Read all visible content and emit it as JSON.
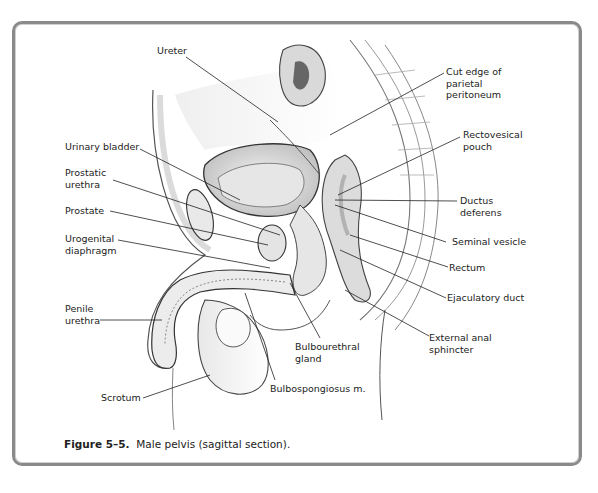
{
  "figure": {
    "number": "Figure 5–5.",
    "caption": "Male pelvis (sagittal section)."
  },
  "labels": {
    "ureter": "Ureter",
    "cut_edge": "Cut edge of\nparietal\nperitoneum",
    "urinary_bladder": "Urinary bladder",
    "rectovesical_pouch": "Rectovesical\npouch",
    "prostatic_urethra": "Prostatic\nurethra",
    "prostate": "Prostate",
    "ductus_deferens": "Ductus\ndeferens",
    "urogenital_diaphragm": "Urogenital\ndiaphragm",
    "seminal_vesicle": "Seminal vesicle",
    "rectum": "Rectum",
    "ejaculatory_duct": "Ejaculatory duct",
    "penile_urethra": "Penile\nurethra",
    "external_anal_sphincter": "External anal\nsphincter",
    "bulbourethral_gland": "Bulbourethral\ngland",
    "bulbospongiosus": "Bulbospongiosus m.",
    "scrotum": "Scrotum"
  }
}
